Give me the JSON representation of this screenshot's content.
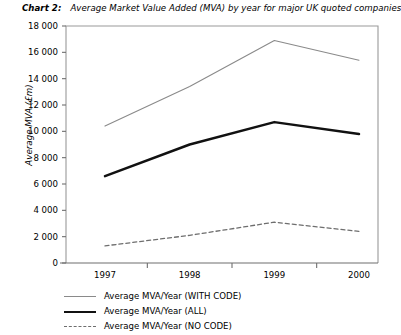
{
  "chart_data": {
    "type": "line",
    "title_label": "Chart 2:",
    "title_text": "Average Market Value Added (MVA) by year for major UK quoted companies",
    "xlabel": "",
    "ylabel": "Average MVA (£m)",
    "categories": [
      "1997",
      "1998",
      "1999",
      "2000"
    ],
    "x": [
      1997,
      1998,
      1999,
      2000
    ],
    "ylim": [
      0,
      18000
    ],
    "ytick_values": [
      0,
      2000,
      4000,
      6000,
      8000,
      10000,
      12000,
      14000,
      16000,
      18000
    ],
    "ytick_labels": [
      "0",
      "2 000",
      "4 000",
      "6 000",
      "8 000",
      "10 000",
      "12 000",
      "14 000",
      "16 000",
      "18 000"
    ],
    "grid": false,
    "legend_position": "below-axes-left",
    "series": [
      {
        "name": "Average MVA/Year (WITH CODE)",
        "values": [
          10400,
          13400,
          16900,
          15400
        ],
        "style": "solid-thin",
        "color": "#8a8a8a"
      },
      {
        "name": "Average MVA/Year (ALL)",
        "values": [
          6600,
          9000,
          10700,
          9800
        ],
        "style": "solid-thick",
        "color": "#111111"
      },
      {
        "name": "Average MVA/Year (NO CODE)",
        "values": [
          1300,
          2100,
          3100,
          2400
        ],
        "style": "dashed",
        "color": "#6e6e6e"
      }
    ]
  },
  "legend": {
    "items": [
      {
        "label": "Average MVA/Year (WITH CODE)",
        "swatch": "thin-solid-line-icon"
      },
      {
        "label": "Average MVA/Year (ALL)",
        "swatch": "thick-solid-line-icon"
      },
      {
        "label": "Average MVA/Year (NO CODE)",
        "swatch": "dashed-line-icon"
      }
    ]
  },
  "axes": {
    "frame_color": "#9a9a9a",
    "axis_color": "#6f6f6f"
  }
}
